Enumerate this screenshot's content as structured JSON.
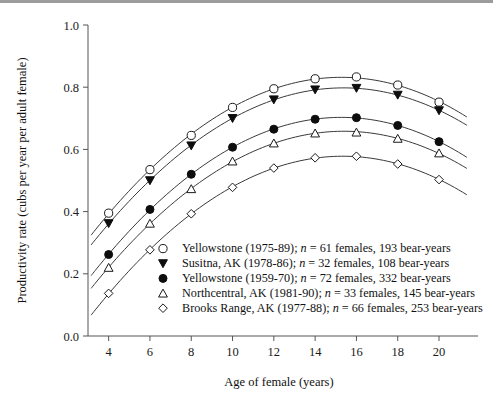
{
  "figure": {
    "background": "#ffffff",
    "axis_color": "#555555",
    "curve_color": "#3a3a3a",
    "marker_fill_color": "#0d0d0d",
    "marker_open_color": "#ffffff"
  },
  "chart_data": {
    "type": "line",
    "title": "",
    "xlabel": "Age of female (years)",
    "ylabel": "Productivity rate (cubs per year per adult female)",
    "xlim": [
      3,
      21.5
    ],
    "ylim": [
      0.0,
      1.0
    ],
    "grid": false,
    "legend_position": "lower-center-inside",
    "xticks": [
      4,
      6,
      8,
      10,
      12,
      14,
      16,
      18,
      20
    ],
    "xtick_labels": [
      "4",
      "6",
      "8",
      "10",
      "12",
      "14",
      "16",
      "18",
      "20"
    ],
    "yticks": [
      0.0,
      0.2,
      0.4,
      0.6,
      0.8,
      1.0
    ],
    "ytick_labels": [
      "0.0",
      "0.2",
      "0.4",
      "0.6",
      "0.8",
      "1.0"
    ],
    "x": [
      4,
      6,
      8,
      10,
      12,
      14,
      16,
      18,
      20
    ],
    "series": [
      {
        "name": "Yellowstone (1975-89)",
        "marker": "open-circle",
        "legend_label": "Yellowstone (1975-89); n = 61 females, 193 bear-years",
        "legend_prefix": "Yellowstone (1975-89); ",
        "legend_n_symbol": "n",
        "legend_suffix": " = 61 females, 193 bear-years",
        "n_females": 61,
        "bear_years": 193,
        "values": [
          0.395,
          0.535,
          0.645,
          0.735,
          0.795,
          0.827,
          0.833,
          0.807,
          0.752
        ]
      },
      {
        "name": "Susitna, AK (1978-86)",
        "marker": "filled-triangle-down",
        "legend_label": "Susitna, AK (1978-86); n = 32 females, 108 bear-years",
        "legend_prefix": "Susitna, AK (1978-86); ",
        "legend_n_symbol": "n",
        "legend_suffix": " = 32 females, 108 bear-years",
        "n_females": 32,
        "bear_years": 108,
        "values": [
          0.362,
          0.5,
          0.612,
          0.7,
          0.76,
          0.792,
          0.797,
          0.775,
          0.725
        ]
      },
      {
        "name": "Yellowstone (1959-70)",
        "marker": "filled-circle",
        "legend_label": "Yellowstone (1959-70); n = 72 females, 332 bear-years",
        "legend_prefix": "Yellowstone (1959-70); ",
        "legend_n_symbol": "n",
        "legend_suffix": " = 72 females, 332 bear-years",
        "n_females": 72,
        "bear_years": 332,
        "values": [
          0.262,
          0.407,
          0.52,
          0.607,
          0.665,
          0.697,
          0.702,
          0.677,
          0.625
        ]
      },
      {
        "name": "Northcentral, AK (1981-90)",
        "marker": "open-triangle-up",
        "legend_label": "Northcentral, AK (1981-90); n = 33 females, 145 bear-years",
        "legend_prefix": "Northcentral, AK (1981-90); ",
        "legend_n_symbol": "n",
        "legend_suffix": " = 33 females, 145 bear-years",
        "n_females": 33,
        "bear_years": 145,
        "values": [
          0.22,
          0.362,
          0.473,
          0.562,
          0.62,
          0.652,
          0.655,
          0.635,
          0.588
        ]
      },
      {
        "name": "Brooks Range, AK (1977-88)",
        "marker": "open-diamond",
        "legend_label": "Brooks Range, AK (1977-88); n = 66 females, 253 bear-years",
        "legend_prefix": "Brooks Range, AK (1977-88); ",
        "legend_n_symbol": "n",
        "legend_suffix": " = 66 females, 253 bear-years",
        "n_females": 66,
        "bear_years": 253,
        "values": [
          0.137,
          0.277,
          0.393,
          0.478,
          0.54,
          0.573,
          0.578,
          0.553,
          0.503
        ]
      }
    ]
  }
}
